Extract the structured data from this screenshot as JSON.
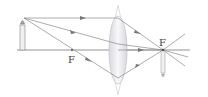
{
  "diagram": {
    "labels": {
      "focal_left": "F",
      "focal_right": "F"
    },
    "colors": {
      "rays": "#8a8a8a",
      "axis": "#7a7a7a",
      "lens_fill": "#ececf0",
      "lens_stroke": "#b8b8c0",
      "label": "#444444"
    },
    "elements": {
      "object": "candle (upright)",
      "image": "candle (inverted, at focal point)",
      "lens": "convex lens"
    }
  }
}
